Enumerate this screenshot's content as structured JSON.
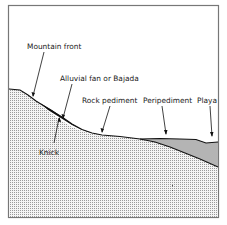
{
  "diagram": {
    "labels": {
      "mountain_front": "Mountain front",
      "alluvial_fan": "Alluvial fan or Bajada",
      "rock_pediment": "Rock pediment",
      "peripediment": "Peripediment",
      "playa": "Playa",
      "knick": "Knick"
    },
    "colors": {
      "frame": "#777777",
      "bedrock_pattern_fg": "#9a9a9a",
      "bedrock_pattern_bg": "#f4f4f4",
      "fan_fill": "#111111",
      "playa_fill": "#b4b4b4",
      "profile_line": "#111111",
      "background": "#ffffff"
    }
  }
}
